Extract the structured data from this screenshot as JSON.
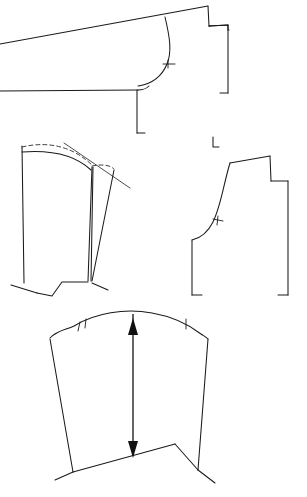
{
  "document": {
    "title": "Garment Pattern Draft Sheet",
    "background_color": "#ffffff",
    "line_color": "#1a1a1a",
    "width_px": 307,
    "height_px": 497,
    "medium": "line drawing"
  },
  "drawing": {
    "type": "technical-pattern-draft",
    "piece_count": 4,
    "pieces": [
      {
        "id": "piece-top-yoke",
        "name": "upper-collar-yoke-piece",
        "position": "top",
        "features": [
          "long-diagonal-top-edge",
          "stepped-right-edge",
          "curved-armhole-corner",
          "single-notch",
          "bracket-hem-marks"
        ],
        "notch_count": 1
      },
      {
        "id": "piece-left-bodice",
        "name": "left-bodice-front-piece",
        "position": "middle-left",
        "features": [
          "dashed-construction-curve",
          "dart-legs",
          "crossing-guide-line",
          "stepped-hem"
        ],
        "notch_count": 0
      },
      {
        "id": "piece-right-bodice",
        "name": "right-side-panel-piece",
        "position": "middle-right",
        "features": [
          "curved-armhole",
          "stepped-shoulder",
          "single-notch",
          "bracket-hem-marks"
        ],
        "notch_count": 1
      },
      {
        "id": "piece-sleeve",
        "name": "sleeve-piece",
        "position": "bottom",
        "features": [
          "sleeve-cap-curve",
          "double-notch-left",
          "single-notch-right",
          "grainline-arrow",
          "v-shaped-hem"
        ],
        "notch_count": 3
      }
    ],
    "annotations": {
      "grainline": {
        "name": "grainline-arrow",
        "style": "double-headed-vertical-arrow",
        "on_piece": "piece-sleeve"
      },
      "construction_lines": {
        "name": "dashed-construction-line",
        "style": "dashed",
        "on_piece": "piece-left-bodice"
      }
    }
  }
}
